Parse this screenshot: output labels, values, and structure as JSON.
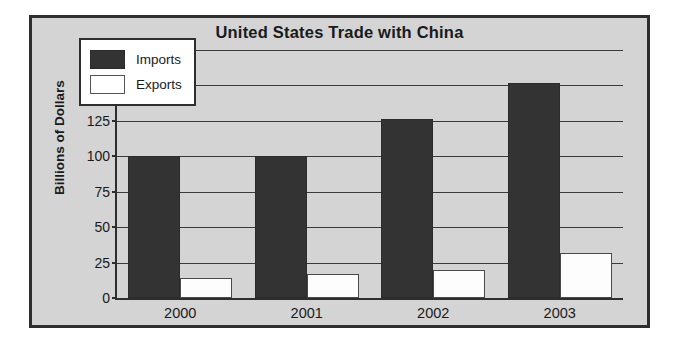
{
  "chart_data": {
    "type": "bar",
    "title": "United States Trade with China",
    "xlabel": "",
    "ylabel": "Billions of Dollars",
    "categories": [
      "2000",
      "2001",
      "2002",
      "2003"
    ],
    "series": [
      {
        "name": "Imports",
        "values": [
          100,
          100,
          126,
          152
        ],
        "color": "#333333"
      },
      {
        "name": "Exports",
        "values": [
          14,
          17,
          20,
          32
        ],
        "color": "#ffffff"
      }
    ],
    "ylim": [
      0,
      175
    ],
    "yticks": [
      0,
      25,
      50,
      75,
      100,
      125,
      150,
      175
    ],
    "grid": true,
    "legend_position": "top-left"
  },
  "figure": {
    "background_color": "#d4d4d4",
    "border_color": "#2e2e2e",
    "axis_color": "#2e2e2e",
    "text_color": "#1a1a1a"
  }
}
